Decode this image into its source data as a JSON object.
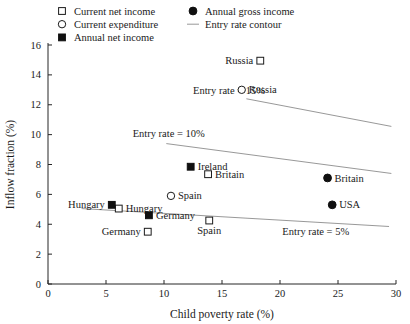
{
  "chart_data": {
    "type": "scatter",
    "title": "",
    "xlabel": "Child poverty rate (%)",
    "ylabel": "Inflow fraction (%)",
    "xlim": [
      0,
      30
    ],
    "ylim": [
      0,
      16
    ],
    "xticks": [
      0,
      5,
      10,
      15,
      20,
      25,
      30
    ],
    "yticks": [
      0,
      2,
      4,
      6,
      8,
      10,
      12,
      14,
      16
    ],
    "grid": false,
    "legend_position": "top",
    "legend": [
      {
        "label": "Current net income",
        "marker": "open-square"
      },
      {
        "label": "Current expenditure",
        "marker": "open-circle"
      },
      {
        "label": "Annual net income",
        "marker": "filled-square"
      },
      {
        "label": "Annual gross income",
        "marker": "filled-circle"
      },
      {
        "label": "Entry rate contour",
        "marker": "line"
      }
    ],
    "series": [
      {
        "name": "Current net income",
        "marker": "open-square",
        "points": [
          {
            "label": "Russia",
            "x": 18.3,
            "y": 14.95,
            "label_side": "left"
          },
          {
            "label": "Britain",
            "x": 13.8,
            "y": 7.35,
            "label_side": "right"
          },
          {
            "label": "Hungary",
            "x": 6.1,
            "y": 5.05,
            "label_side": "right"
          },
          {
            "label": "Spain",
            "x": 13.9,
            "y": 4.25,
            "label_side": "below"
          },
          {
            "label": "Germany",
            "x": 8.6,
            "y": 3.5,
            "label_side": "left"
          }
        ]
      },
      {
        "name": "Current expenditure",
        "marker": "open-circle",
        "points": [
          {
            "label": "Russia",
            "x": 16.7,
            "y": 13.0,
            "label_side": "right"
          },
          {
            "label": "Spain",
            "x": 10.6,
            "y": 5.9,
            "label_side": "right"
          }
        ]
      },
      {
        "name": "Annual net income",
        "marker": "filled-square",
        "points": [
          {
            "label": "Ireland",
            "x": 12.3,
            "y": 7.85,
            "label_side": "right"
          },
          {
            "label": "Hungary",
            "x": 5.5,
            "y": 5.3,
            "label_side": "left"
          },
          {
            "label": "Germany",
            "x": 8.7,
            "y": 4.6,
            "label_side": "right"
          }
        ]
      },
      {
        "name": "Annual gross income",
        "marker": "filled-circle",
        "points": [
          {
            "label": "Britain",
            "x": 24.1,
            "y": 7.1,
            "label_side": "right"
          },
          {
            "label": "USA",
            "x": 24.5,
            "y": 5.3,
            "label_side": "right"
          }
        ]
      }
    ],
    "contours": [
      {
        "label": "Entry rate = 15%",
        "value": 15,
        "label_x": 12.5,
        "label_y": 12.75,
        "x_start": 17.1,
        "y_start": 12.4,
        "x_end": 29.6,
        "y_end": 10.55
      },
      {
        "label": "Entry rate = 10%",
        "value": 10,
        "label_x": 7.3,
        "label_y": 9.85,
        "x_start": 10.2,
        "y_start": 9.4,
        "x_end": 29.6,
        "y_end": 7.4
      },
      {
        "label": "Entry rate = 5%",
        "value": 5,
        "label_x": 20.2,
        "label_y": 3.25,
        "x_start": 2.9,
        "y_start": 5.05,
        "x_end": 29.4,
        "y_end": 3.85
      }
    ]
  }
}
